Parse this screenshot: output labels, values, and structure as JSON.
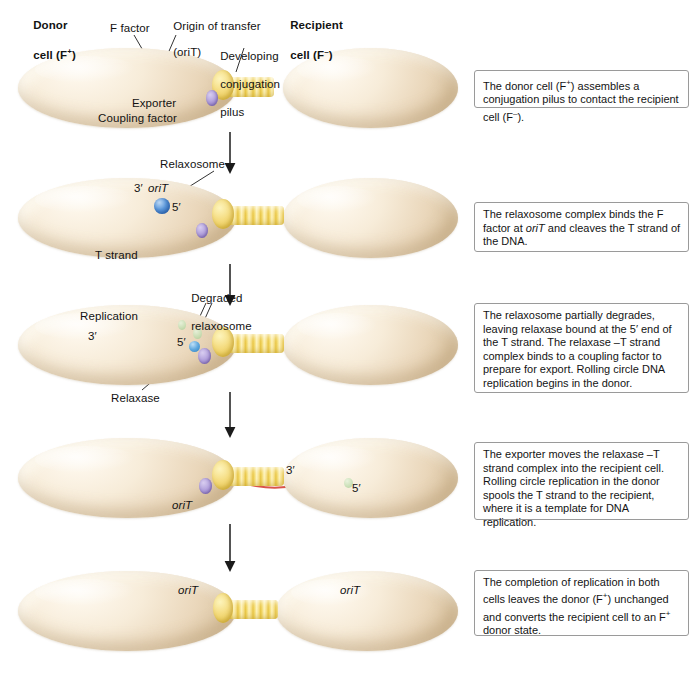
{
  "figure": {
    "type": "process-diagram",
    "steps": 5
  },
  "headers": {
    "donor_line1": "Donor",
    "donor_line2": "cell (F⁺)",
    "recipient_line1": "Recipient",
    "recipient_line2": "cell (F⁻)",
    "f_factor": "F factor",
    "origin_line1": "Origin of transfer",
    "origin_line2": "(oriT)",
    "pilus_line1": "Developing",
    "pilus_line2": "conjugation",
    "pilus_line3": "pilus",
    "exporter": "Exporter",
    "coupling_factor": "Coupling factor"
  },
  "row2_labels": {
    "relaxosome": "Relaxosome",
    "three_prime": "3′",
    "orit": "oriT",
    "five_prime": "5′",
    "t_strand": "T strand"
  },
  "row3_labels": {
    "degraded_line1": "Degraded",
    "degraded_line2": "relaxosome",
    "replication": "Replication",
    "three_prime": "3′",
    "five_prime": "5′",
    "relaxase": "Relaxase"
  },
  "row4_labels": {
    "orit": "oriT",
    "three_prime": "3′",
    "five_prime": "5′"
  },
  "row5_labels": {
    "orit_donor": "oriT",
    "orit_recipient": "oriT"
  },
  "captions": [
    {
      "id": "caption-1",
      "text": "The donor cell (F⁺) assembles a conjugation pilus to contact the recipient cell (F⁻)."
    },
    {
      "id": "caption-2",
      "text": "The relaxosome complex binds the F factor at oriT and cleaves the T strand of the DNA."
    },
    {
      "id": "caption-3",
      "text": "The relaxosome partially degrades, leaving relaxase bound at the 5′ end of the T strand. The relaxase –T strand complex binds to a coupling factor to prepare for export. Rolling circle DNA replication begins in the donor."
    },
    {
      "id": "caption-4",
      "text": "The exporter moves the relaxase –T strand complex into the recipient cell. Rolling circle replication in the donor spools the T strand to the recipient, where it is a template for DNA replication."
    },
    {
      "id": "caption-5",
      "text": "The completion of replication in both cells leaves the donor (F⁺) unchanged and converts the recipient cell to an F⁺ donor state."
    }
  ],
  "colors": {
    "chromosome_dna": "#7ba7d7",
    "f_factor_dna": "#d9544a",
    "hybrid_dna_blue": "#8e8fc8",
    "cell_body": "#f0e0c6",
    "pilus": "#f3d96b",
    "coupling_factor": "#9a84cd",
    "relaxosome": "#3d7fc9",
    "degraded_relaxosome": "#b9d6a7",
    "caption_border": "#9a9a9a"
  },
  "icons": {
    "step_arrow": "down-arrow-icon",
    "leader_line": "leader-line-icon"
  }
}
